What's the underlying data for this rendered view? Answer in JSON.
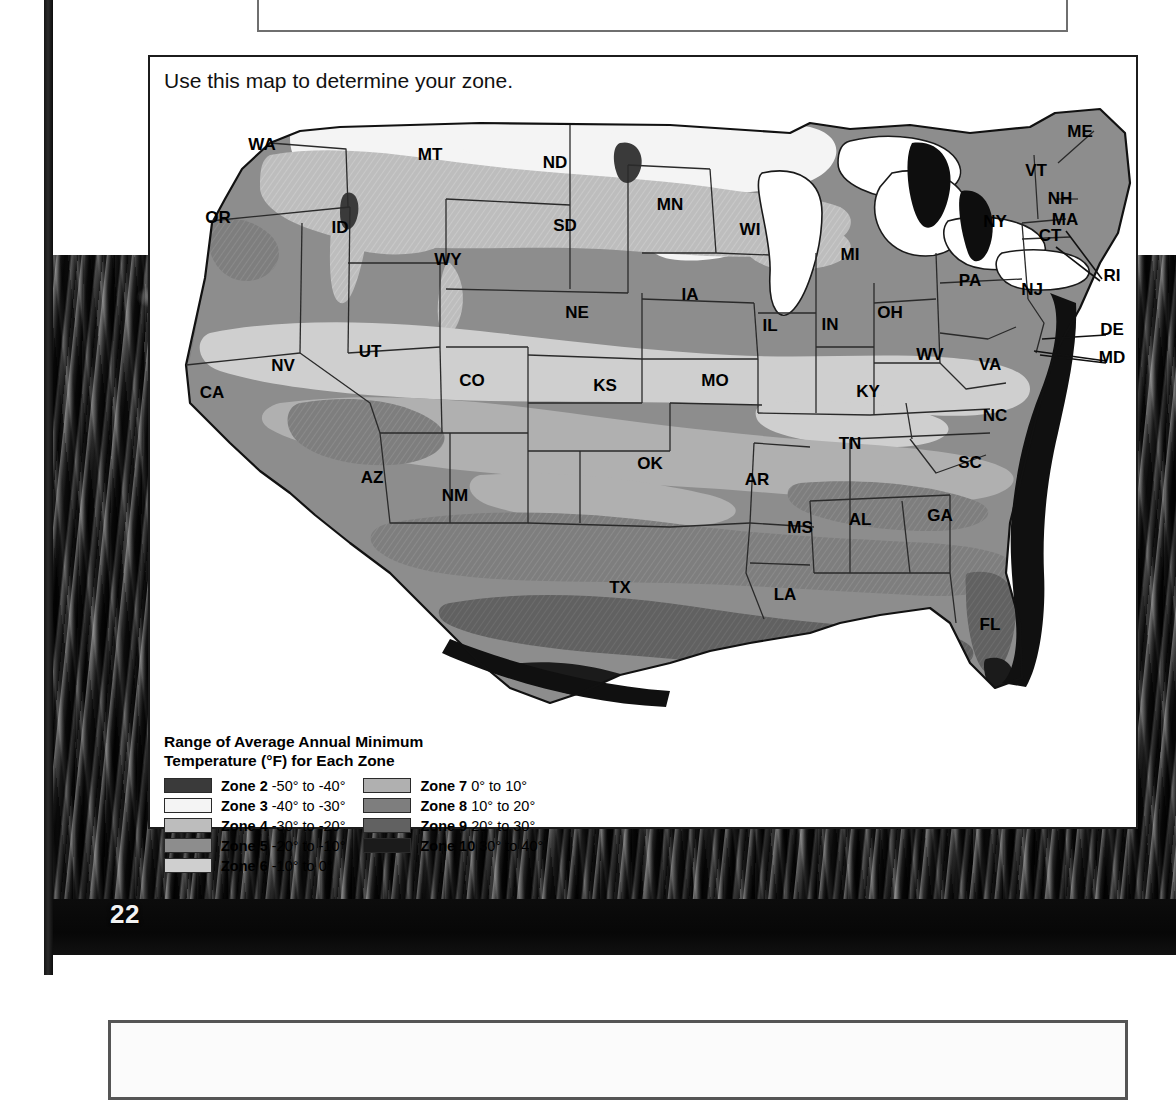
{
  "page": {
    "page_number": "22",
    "top_box_caption": ""
  },
  "map_panel": {
    "caption": "Use this map to determine your zone.",
    "legend": {
      "title_line1": "Range of Average Annual Minimum",
      "title_line2": "Temperature (°F) for Each Zone",
      "column_left": [
        {
          "zone": "Zone 2",
          "range": "-50° to -40°",
          "color": "#3a3a3a"
        },
        {
          "zone": "Zone 3",
          "range": "-40° to -30°",
          "color": "#f4f4f4"
        },
        {
          "zone": "Zone 4",
          "range": "-30° to -20°",
          "color": "#bdbdbd"
        },
        {
          "zone": "Zone 5",
          "range": "-20° to -10°",
          "color": "#8d8d8d"
        },
        {
          "zone": "Zone 6",
          "range": "-10° to 0°",
          "color": "#cfcfcf"
        }
      ],
      "column_right": [
        {
          "zone": "Zone 7",
          "range": "0° to 10°",
          "color": "#b0b0b0"
        },
        {
          "zone": "Zone 8",
          "range": "10° to 20°",
          "color": "#7e7e7e"
        },
        {
          "zone": "Zone 9",
          "range": "20° to 30°",
          "color": "#616161"
        },
        {
          "zone": "Zone 10",
          "range": "30° to 40°",
          "color": "#1b1b1b"
        }
      ]
    },
    "state_labels": [
      {
        "code": "WA",
        "x": 112,
        "y": 47
      },
      {
        "code": "OR",
        "x": 68,
        "y": 120
      },
      {
        "code": "ID",
        "x": 190,
        "y": 130
      },
      {
        "code": "MT",
        "x": 280,
        "y": 57
      },
      {
        "code": "ND",
        "x": 405,
        "y": 65
      },
      {
        "code": "SD",
        "x": 415,
        "y": 128
      },
      {
        "code": "WY",
        "x": 298,
        "y": 162
      },
      {
        "code": "NV",
        "x": 133,
        "y": 268
      },
      {
        "code": "CA",
        "x": 62,
        "y": 295
      },
      {
        "code": "UT",
        "x": 220,
        "y": 254
      },
      {
        "code": "CO",
        "x": 322,
        "y": 283
      },
      {
        "code": "NE",
        "x": 427,
        "y": 215
      },
      {
        "code": "MN",
        "x": 520,
        "y": 107
      },
      {
        "code": "IA",
        "x": 540,
        "y": 197
      },
      {
        "code": "WI",
        "x": 600,
        "y": 132
      },
      {
        "code": "MI",
        "x": 700,
        "y": 157
      },
      {
        "code": "KS",
        "x": 455,
        "y": 288
      },
      {
        "code": "MO",
        "x": 565,
        "y": 283
      },
      {
        "code": "IL",
        "x": 620,
        "y": 228
      },
      {
        "code": "IN",
        "x": 680,
        "y": 227
      },
      {
        "code": "OH",
        "x": 740,
        "y": 215
      },
      {
        "code": "PA",
        "x": 820,
        "y": 183
      },
      {
        "code": "NY",
        "x": 845,
        "y": 124
      },
      {
        "code": "ME",
        "x": 930,
        "y": 34
      },
      {
        "code": "VT",
        "x": 886,
        "y": 73
      },
      {
        "code": "NH",
        "x": 910,
        "y": 101
      },
      {
        "code": "MA",
        "x": 915,
        "y": 122
      },
      {
        "code": "CT",
        "x": 900,
        "y": 138
      },
      {
        "code": "NJ",
        "x": 882,
        "y": 192
      },
      {
        "code": "WV",
        "x": 780,
        "y": 257
      },
      {
        "code": "VA",
        "x": 840,
        "y": 267
      },
      {
        "code": "KY",
        "x": 718,
        "y": 294
      },
      {
        "code": "TN",
        "x": 700,
        "y": 346
      },
      {
        "code": "NC",
        "x": 845,
        "y": 318
      },
      {
        "code": "SC",
        "x": 820,
        "y": 365
      },
      {
        "code": "GA",
        "x": 790,
        "y": 418
      },
      {
        "code": "AL",
        "x": 710,
        "y": 422
      },
      {
        "code": "MS",
        "x": 650,
        "y": 430
      },
      {
        "code": "AR",
        "x": 607,
        "y": 382
      },
      {
        "code": "OK",
        "x": 500,
        "y": 366
      },
      {
        "code": "LA",
        "x": 635,
        "y": 497
      },
      {
        "code": "TX",
        "x": 470,
        "y": 490
      },
      {
        "code": "NM",
        "x": 305,
        "y": 398
      },
      {
        "code": "AZ",
        "x": 222,
        "y": 380
      },
      {
        "code": "FL",
        "x": 840,
        "y": 527
      }
    ],
    "callout_labels": [
      {
        "code": "RI",
        "x": 962,
        "y": 178
      },
      {
        "code": "DE",
        "x": 962,
        "y": 232
      },
      {
        "code": "MD",
        "x": 962,
        "y": 260
      }
    ]
  }
}
